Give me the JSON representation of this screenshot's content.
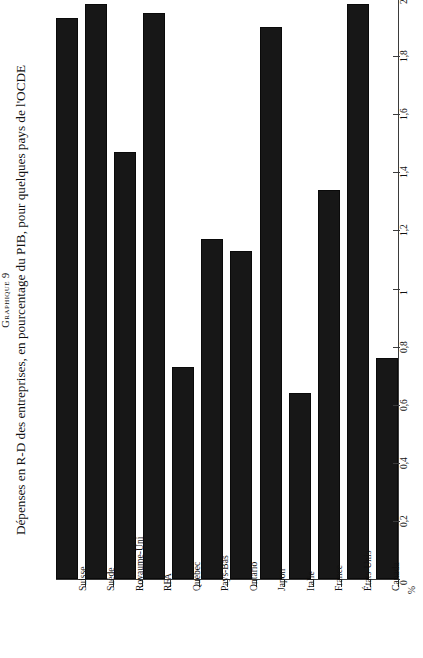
{
  "caption": {
    "label": "Graphique 9",
    "title": "Dépenses en R-D des entreprises, en pourcentage du PIB, pour quelques pays de l'OCDE"
  },
  "axis": {
    "unit": "%",
    "y_ticks": [
      "0",
      "0,2",
      "0,4",
      "0,6",
      "0,8",
      "1",
      "1,2",
      "1,4",
      "1,6",
      "1,8",
      "2"
    ]
  },
  "chart_data": {
    "type": "bar",
    "title": "Dépenses en R-D des entreprises, en pourcentage du PIB, pour quelques pays de l'OCDE",
    "subtitle": "Graphique 9",
    "xlabel": "",
    "ylabel": "%",
    "ylim": [
      0,
      2
    ],
    "ytick_values": [
      0,
      0.2,
      0.4,
      0.6,
      0.8,
      1,
      1.2,
      1.4,
      1.6,
      1.8,
      2
    ],
    "ytick_labels": [
      "0",
      "0,2",
      "0,4",
      "0,6",
      "0,8",
      "1",
      "1,2",
      "1,4",
      "1,6",
      "1,8",
      "2"
    ],
    "grid": false,
    "legend": false,
    "bar_color": "#171717",
    "categories": [
      "Suisse",
      "Suède",
      "Royaume-Uni",
      "RFA",
      "Québec",
      "Pays-Bas",
      "Ontario",
      "Japon",
      "Italie",
      "France",
      "États-Unis",
      "Canada"
    ],
    "values": [
      1.93,
      1.98,
      1.47,
      1.95,
      0.73,
      1.17,
      1.13,
      1.9,
      0.64,
      1.34,
      1.98,
      0.76
    ]
  }
}
